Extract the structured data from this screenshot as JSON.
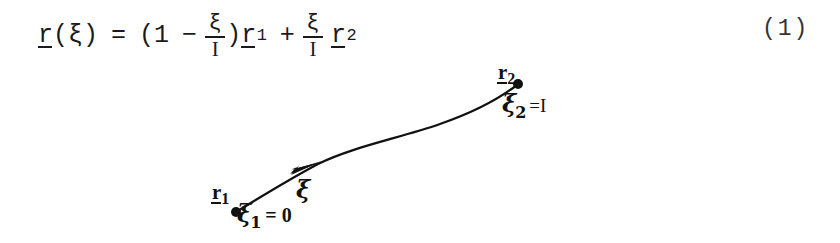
{
  "equation": {
    "lhs_vector": "r",
    "lhs_arg_open": "(",
    "lhs_arg": "ξ",
    "lhs_arg_close": ")",
    "equals": "=",
    "paren_open": "(",
    "one": "1",
    "minus": "−",
    "frac1_num": "ξ",
    "frac1_den": "I",
    "paren_close": ")",
    "term1_vector": "r",
    "term1_sub": "1",
    "plus": "+",
    "frac2_num": "ξ",
    "frac2_den": "I",
    "term2_vector": "r",
    "term2_sub": "2",
    "number": "(1)"
  },
  "diagram": {
    "point_start": {
      "vector_label": "r",
      "vector_sub": "1",
      "param_label": "ξ",
      "param_sub": "1",
      "param_equals": "= 0",
      "dot_x": 235,
      "dot_y": 212
    },
    "point_end": {
      "vector_label": "r",
      "vector_sub": "2",
      "param_label": "ξ",
      "param_sub": "2",
      "param_equals": "=I",
      "dot_x": 518,
      "dot_y": 84
    },
    "curve_param_label": "ξ",
    "arrow_direction": "up-right"
  },
  "colors": {
    "ink": "#111111",
    "background": "#ffffff"
  }
}
